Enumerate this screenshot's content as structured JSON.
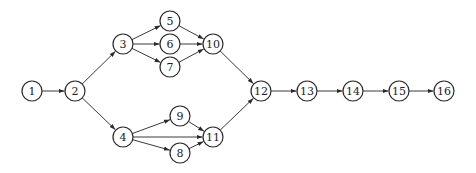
{
  "diagram": {
    "type": "activity-network",
    "node_radius": 10,
    "colors": {
      "stroke": "#2a2a2a",
      "edge": "#3a3a3a",
      "background": "#ffffff",
      "text": "#222222"
    },
    "nodes": [
      {
        "id": "1",
        "label": "1",
        "x": 32,
        "y": 91
      },
      {
        "id": "2",
        "label": "2",
        "x": 75,
        "y": 91
      },
      {
        "id": "3",
        "label": "3",
        "x": 123,
        "y": 44
      },
      {
        "id": "4",
        "label": "4",
        "x": 123,
        "y": 137
      },
      {
        "id": "5",
        "label": "5",
        "x": 170,
        "y": 21
      },
      {
        "id": "6",
        "label": "6",
        "x": 170,
        "y": 44
      },
      {
        "id": "7",
        "label": "7",
        "x": 170,
        "y": 67
      },
      {
        "id": "8",
        "label": "8",
        "x": 180,
        "y": 153
      },
      {
        "id": "9",
        "label": "9",
        "x": 180,
        "y": 116
      },
      {
        "id": "10",
        "label": "10",
        "x": 213,
        "y": 44
      },
      {
        "id": "11",
        "label": "11",
        "x": 213,
        "y": 137
      },
      {
        "id": "12",
        "label": "12",
        "x": 261,
        "y": 91
      },
      {
        "id": "13",
        "label": "13",
        "x": 307,
        "y": 91
      },
      {
        "id": "14",
        "label": "14",
        "x": 353,
        "y": 91
      },
      {
        "id": "15",
        "label": "15",
        "x": 399,
        "y": 91
      },
      {
        "id": "16",
        "label": "16",
        "x": 444,
        "y": 91
      }
    ],
    "edges": [
      {
        "from": "1",
        "to": "2"
      },
      {
        "from": "2",
        "to": "3"
      },
      {
        "from": "2",
        "to": "4"
      },
      {
        "from": "3",
        "to": "5"
      },
      {
        "from": "3",
        "to": "6"
      },
      {
        "from": "3",
        "to": "7"
      },
      {
        "from": "5",
        "to": "10"
      },
      {
        "from": "6",
        "to": "10"
      },
      {
        "from": "7",
        "to": "10"
      },
      {
        "from": "4",
        "to": "9"
      },
      {
        "from": "4",
        "to": "11"
      },
      {
        "from": "4",
        "to": "8"
      },
      {
        "from": "9",
        "to": "11"
      },
      {
        "from": "8",
        "to": "11"
      },
      {
        "from": "10",
        "to": "12"
      },
      {
        "from": "11",
        "to": "12"
      },
      {
        "from": "12",
        "to": "13"
      },
      {
        "from": "13",
        "to": "14"
      },
      {
        "from": "14",
        "to": "15"
      },
      {
        "from": "15",
        "to": "16"
      }
    ]
  }
}
